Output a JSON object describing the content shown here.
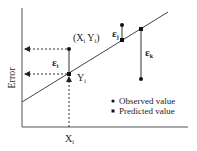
{
  "diagram": {
    "y_axis_label": "Error",
    "x_tick_label": "X",
    "x_tick_sub": "i",
    "point_label": "(X",
    "point_label_sub1": "i",
    "point_label_mid": " Y",
    "point_label_sub2": "i",
    "point_label_end": ")",
    "yi_label": "Y",
    "yi_sub": "i",
    "epsilon_i": "ε",
    "epsilon_i_sub": "i",
    "epsilon_j": "ε",
    "epsilon_j_sub": "j",
    "epsilon_k": "ε",
    "epsilon_k_sub": "k",
    "legend": {
      "observed": "Observed value",
      "predicted": "Predicted value"
    },
    "colors": {
      "line": "#444444",
      "point": "#111111",
      "text": "#222222"
    }
  }
}
